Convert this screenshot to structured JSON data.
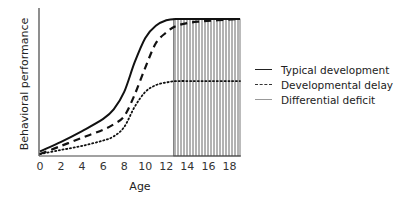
{
  "chart_data": {
    "type": "line",
    "title": "",
    "xlabel": "Age",
    "ylabel": "Behavioral performance",
    "xlim": [
      0,
      19
    ],
    "ylim": [
      0,
      1
    ],
    "x_ticks": [
      "0",
      "2",
      "4",
      "6",
      "8",
      "10",
      "12",
      "14",
      "16",
      "18"
    ],
    "y_ticks": [],
    "grid": false,
    "legend_position": "right",
    "series": [
      {
        "name": "Typical development",
        "style": "solid",
        "x": [
          0,
          2,
          4,
          6,
          7,
          8,
          9,
          10,
          11,
          12,
          13,
          15,
          19
        ],
        "y": [
          0.02,
          0.09,
          0.17,
          0.26,
          0.33,
          0.46,
          0.68,
          0.86,
          0.95,
          0.99,
          1.0,
          1.0,
          1.0
        ]
      },
      {
        "name": "Developmental delay",
        "style": "dashed",
        "x": [
          0,
          2,
          4,
          6,
          7,
          8,
          9,
          10,
          11,
          12,
          13,
          15,
          19
        ],
        "y": [
          0.0,
          0.06,
          0.12,
          0.18,
          0.22,
          0.28,
          0.44,
          0.64,
          0.82,
          0.9,
          0.95,
          0.98,
          1.0
        ]
      },
      {
        "name": "Differential deficit",
        "style": "dotted",
        "x": [
          0,
          2,
          4,
          6,
          7,
          8,
          9,
          10,
          11,
          12,
          13,
          15,
          19
        ],
        "y": [
          0.0,
          0.03,
          0.06,
          0.1,
          0.13,
          0.2,
          0.35,
          0.46,
          0.51,
          0.53,
          0.54,
          0.54,
          0.54
        ]
      }
    ],
    "annotations": [
      {
        "type": "hatched-region",
        "x_from": 12.7,
        "x_to": 19,
        "pattern": "vertical-lines"
      }
    ]
  },
  "legend": {
    "items": [
      {
        "label": "Typical development",
        "style": "solid"
      },
      {
        "label": "Developmental delay",
        "style": "dashed"
      },
      {
        "label": "Differential deficit",
        "style": "thin"
      }
    ]
  },
  "axes": {
    "x_label": "Age",
    "y_label": "Behavioral performance",
    "x_ticks": [
      "0",
      "2",
      "4",
      "6",
      "8",
      "10",
      "12",
      "14",
      "16",
      "18"
    ]
  }
}
